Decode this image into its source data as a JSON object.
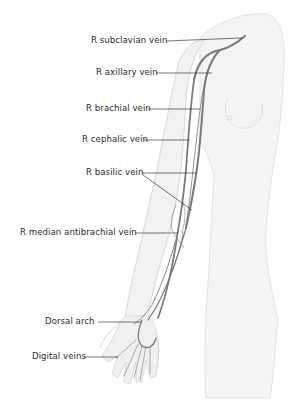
{
  "diagram": {
    "colors": {
      "vein": "#7a7a7a",
      "leader_line": "#3a3a3a",
      "body_fill": "#f3f3f3",
      "body_outline": "#dcdcdc",
      "text": "#2a2a2a"
    },
    "labels": [
      {
        "id": "subclavian",
        "text": "R subclavian vein"
      },
      {
        "id": "axillary",
        "text": "R axillary vein"
      },
      {
        "id": "brachial",
        "text": "R brachial vein"
      },
      {
        "id": "cephalic",
        "text": "R cephalic vein"
      },
      {
        "id": "basilic",
        "text": "R basilic vein"
      },
      {
        "id": "median_antibrachial",
        "text": "R median antibrachial vein"
      },
      {
        "id": "dorsal_arch",
        "text": "Dorsal arch"
      },
      {
        "id": "digital",
        "text": "Digital veins"
      }
    ]
  }
}
